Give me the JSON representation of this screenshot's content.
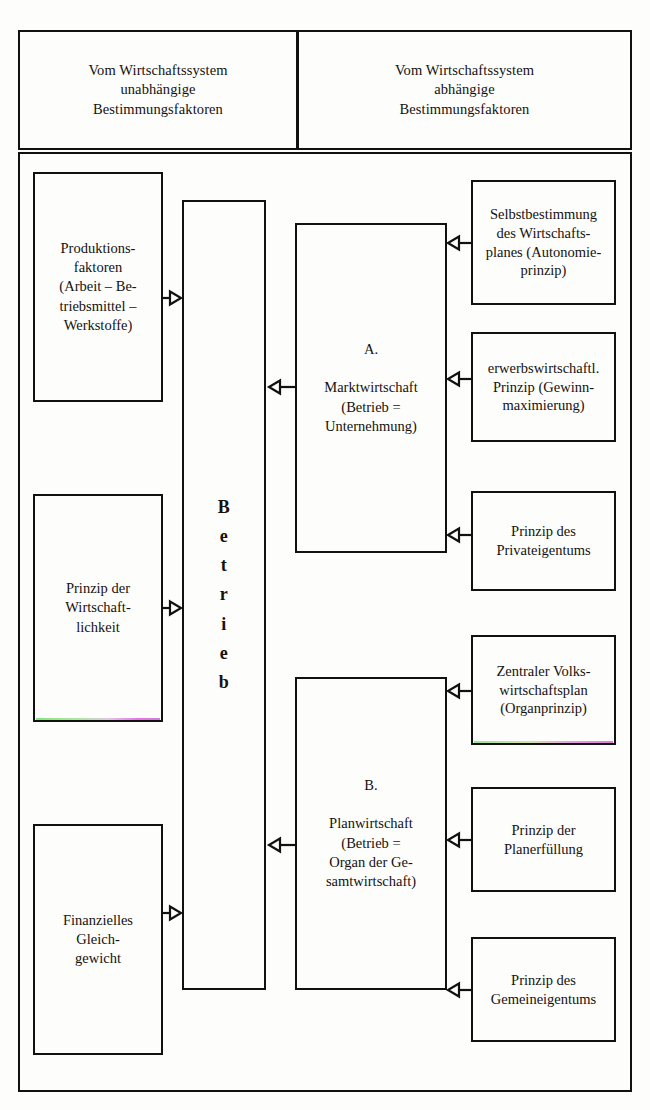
{
  "diagram": {
    "type": "block-diagram",
    "title_present": false,
    "headers": [
      {
        "id": "independent",
        "text": "Vom Wirtschaftssystem\nunabhängige\nBestimmungsfaktoren"
      },
      {
        "id": "dependent",
        "text": "Vom Wirtschaftssystem\nabhängige\nBestimmungsfaktoren"
      }
    ],
    "left_nodes": [
      {
        "id": "produktionsfaktoren",
        "text": "Produktions-\nfaktoren\n(Arbeit – Be-\ntriebsmittel –\nWerkstoffe)"
      },
      {
        "id": "wirtschaftlichkeit",
        "text": "Prinzip der\nWirtschaft-\nlichkeit"
      },
      {
        "id": "gleichgewicht",
        "text": "Finanzielles\nGleich-\ngewicht"
      }
    ],
    "center_node": {
      "id": "betrieb",
      "text": "B\ne\nt\nr\ni\ne\nb",
      "orientation": "vertical"
    },
    "system_nodes": [
      {
        "id": "marktwirtschaft",
        "label": "A.",
        "text": "A.\n\nMarktwirtschaft\n(Betrieb =\nUnternehmung)"
      },
      {
        "id": "planwirtschaft",
        "label": "B.",
        "text": "B.\n\nPlanwirtschaft\n(Betrieb =\nOrgan der Ge-\nsamtwirtschaft)"
      }
    ],
    "right_nodes": [
      {
        "id": "autonomieprinzip",
        "text": "Selbstbestimmung\ndes Wirtschafts-\nplanes (Autonomie-\nprinzip)",
        "group": "A"
      },
      {
        "id": "erwerbsprinzip",
        "text": "erwerbswirtschaftl.\nPrinzip (Gewinn-\nmaximierung)",
        "group": "A"
      },
      {
        "id": "privateigentum",
        "text": "Prinzip des\nPrivateigentums",
        "group": "A"
      },
      {
        "id": "organprinzip",
        "text": "Zentraler Volks-\nwirtschaftsplan\n(Organprinzip)",
        "group": "B"
      },
      {
        "id": "planerfuellung",
        "text": "Prinzip der\nPlanerfüllung",
        "group": "B"
      },
      {
        "id": "gemeineigentum",
        "text": "Prinzip des\nGemeineigentums",
        "group": "B"
      }
    ],
    "arrows": [
      {
        "id": "produktionsfaktoren-to-betrieb",
        "direction": "right"
      },
      {
        "id": "wirtschaftlichkeit-to-betrieb",
        "direction": "right"
      },
      {
        "id": "gleichgewicht-to-betrieb",
        "direction": "right"
      },
      {
        "id": "marktwirtschaft-to-betrieb",
        "direction": "left"
      },
      {
        "id": "planwirtschaft-to-betrieb",
        "direction": "left"
      },
      {
        "id": "autonomieprinzip-to-marktwirtschaft",
        "direction": "left"
      },
      {
        "id": "erwerbsprinzip-to-marktwirtschaft",
        "direction": "left"
      },
      {
        "id": "privateigentum-to-marktwirtschaft",
        "direction": "left"
      },
      {
        "id": "organprinzip-to-planwirtschaft",
        "direction": "left"
      },
      {
        "id": "planerfuellung-to-planwirtschaft",
        "direction": "left"
      },
      {
        "id": "gemeineigentum-to-planwirtschaft",
        "direction": "left"
      }
    ],
    "colors": {
      "ink": "#141210",
      "rule": "#111111",
      "background": "#fdfdfb"
    }
  }
}
